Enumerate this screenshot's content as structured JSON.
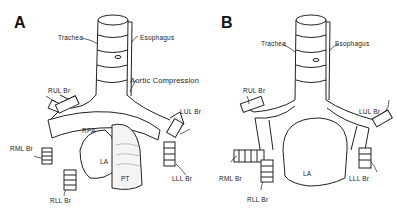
{
  "figure": {
    "panels": [
      {
        "letter": "A",
        "labels": {
          "trachea": "Trachea",
          "esophagus": "Esophagus",
          "aortic_compression": "Aortic Compression",
          "rul": "RUL Br",
          "lul": "LUL Br",
          "rpa": "RPA",
          "rml": "RML Br",
          "la": "LA",
          "lll": "LLL Br",
          "pt": "PT",
          "rll": "RLL Br"
        }
      },
      {
        "letter": "B",
        "labels": {
          "trachea": "Trachea",
          "esophagus": "Esophagus",
          "rul": "RUL Br",
          "lul": "LUL Br",
          "rml": "RML Br",
          "la": "LA",
          "lll": "LLL Br",
          "rll": "RLL Br"
        }
      }
    ]
  }
}
